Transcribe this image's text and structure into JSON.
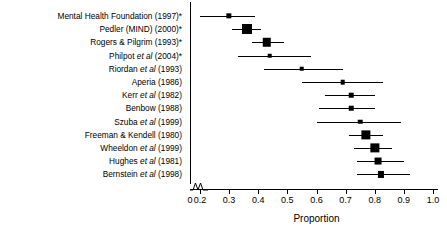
{
  "chart_data": {
    "type": "scatter",
    "subtype": "forest-plot",
    "title": "",
    "xlabel": "Proportion",
    "ylabel": "",
    "xlim": [
      0.15,
      1.0
    ],
    "axis_break": true,
    "grid": false,
    "legend": "none",
    "xticks": [
      {
        "value": 0.0,
        "label": "0"
      },
      {
        "value": 0.2,
        "label": "0.2"
      },
      {
        "value": 0.3,
        "label": "0.3"
      },
      {
        "value": 0.4,
        "label": "0.4"
      },
      {
        "value": 0.5,
        "label": "0.5"
      },
      {
        "value": 0.6,
        "label": "0.6"
      },
      {
        "value": 0.7,
        "label": "0.7"
      },
      {
        "value": 0.8,
        "label": "0.8"
      },
      {
        "value": 0.9,
        "label": "0.9"
      },
      {
        "value": 1.0,
        "label": "1.0"
      }
    ],
    "categories": [
      "Mental Health Foundation (1997)*",
      "Pedler (MIND) (2000)*",
      "Rogers & Pilgrim (1993)*",
      "Philpot et al (2004)*",
      "Riordan et al (1993)",
      "Aperia (1986)",
      "Kerr et al (1982)",
      "Benbow (1988)",
      "Szuba et al (1999)",
      "Freeman & Kendell (1980)",
      "Wheeldon et al (1999)",
      "Hughes et al (1981)",
      "Bernstein et al (1998)"
    ],
    "points": [
      {
        "study": "Mental Health Foundation (1997)*",
        "label_html": "Mental Health Foundation (1997)*",
        "proportion": 0.3,
        "ci_low": 0.2,
        "ci_high": 0.39,
        "weight": 3
      },
      {
        "study": "Pedler (MIND) (2000)*",
        "label_html": "Pedler (MIND) (2000)*",
        "proportion": 0.36,
        "ci_low": 0.31,
        "ci_high": 0.41,
        "weight": 9
      },
      {
        "study": "Rogers & Pilgrim (1993)*",
        "label_html": "Rogers &amp; Pilgrim (1993)*",
        "proportion": 0.43,
        "ci_low": 0.38,
        "ci_high": 0.49,
        "weight": 7
      },
      {
        "study": "Philpot et al (2004)*",
        "label_html": "Philpot <i>et al</i> (2004)*",
        "proportion": 0.44,
        "ci_low": 0.33,
        "ci_high": 0.58,
        "weight": 2
      },
      {
        "study": "Riordan et al (1993)",
        "label_html": "Riordan <i>et al</i> (1993)",
        "proportion": 0.55,
        "ci_low": 0.42,
        "ci_high": 0.69,
        "weight": 2
      },
      {
        "study": "Aperia (1986)",
        "label_html": "Aperia (1986)",
        "proportion": 0.69,
        "ci_low": 0.55,
        "ci_high": 0.83,
        "weight": 2
      },
      {
        "study": "Kerr et al (1982)",
        "label_html": "Kerr <i>et al</i> (1982)",
        "proportion": 0.72,
        "ci_low": 0.63,
        "ci_high": 0.8,
        "weight": 2
      },
      {
        "study": "Benbow (1988)",
        "label_html": "Benbow (1988)",
        "proportion": 0.72,
        "ci_low": 0.61,
        "ci_high": 0.8,
        "weight": 2
      },
      {
        "study": "Szuba et al (1999)",
        "label_html": "Szuba <i>et al</i> (1999)",
        "proportion": 0.75,
        "ci_low": 0.6,
        "ci_high": 0.89,
        "weight": 2
      },
      {
        "study": "Freeman & Kendell (1980)",
        "label_html": "Freeman &amp; Kendell (1980)",
        "proportion": 0.77,
        "ci_low": 0.71,
        "ci_high": 0.83,
        "weight": 8
      },
      {
        "study": "Wheeldon et al (1999)",
        "label_html": "Wheeldon <i>et al</i> (1999)",
        "proportion": 0.8,
        "ci_low": 0.73,
        "ci_high": 0.86,
        "weight": 8
      },
      {
        "study": "Hughes et al (1981)",
        "label_html": "Hughes <i>et al</i> (1981)",
        "proportion": 0.81,
        "ci_low": 0.74,
        "ci_high": 0.9,
        "weight": 5
      },
      {
        "study": "Bernstein et al (1998)",
        "label_html": "Bernstein <i>et al</i> (1998)",
        "proportion": 0.82,
        "ci_low": 0.74,
        "ci_high": 0.92,
        "weight": 4
      }
    ]
  }
}
